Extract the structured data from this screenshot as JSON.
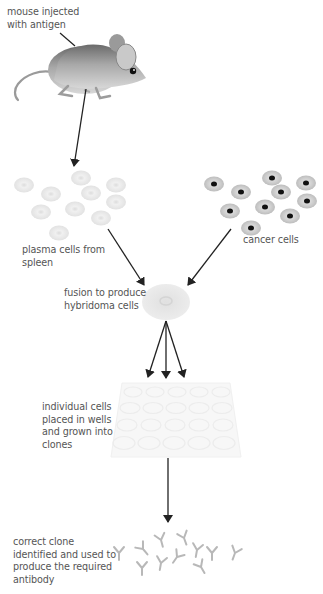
{
  "diagram": {
    "colors": {
      "text": "#555555",
      "arrow": "#222222",
      "plasma_cell": "#e6e6e6",
      "cancer_cell": "#c8c8c8",
      "nucleus": "#111111",
      "antibody": "#bbbbbb",
      "well_plate": "#f6f6f6"
    },
    "labels": {
      "mouse": [
        "mouse injected",
        "with antigen"
      ],
      "plasma": [
        "plasma cells from",
        "spleen"
      ],
      "cancer": [
        "cancer cells"
      ],
      "fusion": [
        "fusion to produce",
        "hybridoma cells"
      ],
      "wells": [
        "individual cells",
        "placed in wells",
        "and grown into",
        "clones"
      ],
      "clone": [
        "correct clone",
        "identified and used to",
        "produce the required",
        "antibody"
      ]
    },
    "icons": {
      "mouse": "mouse-illustration",
      "plasma_cell": "plasma-cell-icon",
      "cancer_cell": "cancer-cell-icon",
      "hybridoma": "hybridoma-cell-icon",
      "well_plate": "well-plate-icon",
      "antibody": "antibody-icon"
    },
    "steps": [
      "mouse injected with antigen",
      "plasma cells from spleen",
      "cancer cells",
      "fusion to produce hybridoma cells",
      "individual cells placed in wells and grown into clones",
      "correct clone identified and used to produce the required antibody"
    ]
  }
}
